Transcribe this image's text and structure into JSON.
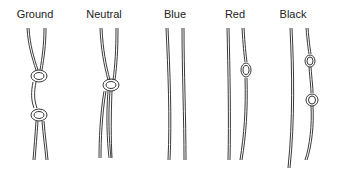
{
  "diagram": {
    "wires": [
      {
        "label": "Ground",
        "knots": 2
      },
      {
        "label": "Neutral",
        "knots": 1
      },
      {
        "label": "Blue",
        "knots": 0
      },
      {
        "label": "Red",
        "knots": 1
      },
      {
        "label": "Black",
        "knots": 2
      }
    ]
  }
}
